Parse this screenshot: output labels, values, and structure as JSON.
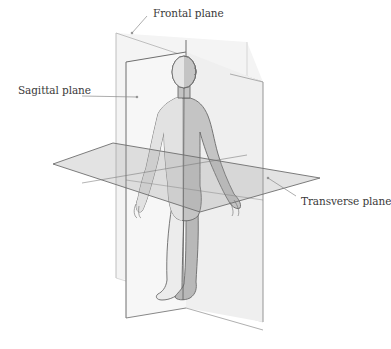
{
  "diagram": {
    "type": "anatomical-planes",
    "labels": {
      "frontal": "Frontal plane",
      "sagittal": "Sagittal plane",
      "transverse": "Transverse plane"
    },
    "colors": {
      "background": "#ffffff",
      "plane_fill": "#dcdcdc",
      "plane_edge_dark": "#6e6e6e",
      "plane_edge_light": "#b5b5b5",
      "body_fill": "#bdbdbd",
      "body_fill_light": "#e4e4e4",
      "body_outline": "#6a6a6a",
      "leader_line": "#8a8a8a",
      "text": "#3a3a3a"
    }
  }
}
